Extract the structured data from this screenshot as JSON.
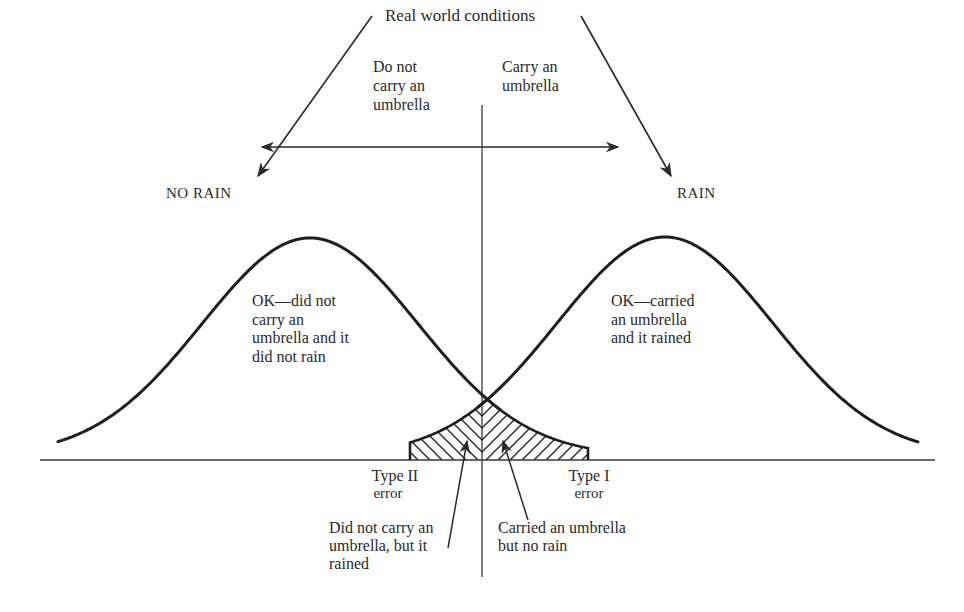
{
  "title": "Real world conditions",
  "decisions": {
    "left": "Do not\ncarry an\numbrella",
    "right": "Carry an\numbrella"
  },
  "states": {
    "left": "NO RAIN",
    "right": "RAIN"
  },
  "regions": {
    "left_ok": "OK—did not\ncarry an\numbrella and it\ndid not rain",
    "right_ok": "OK—carried\nan umbrella\nand it rained"
  },
  "errors": {
    "type2": {
      "title": "Type II",
      "sub": "error",
      "description": "Did not carry an\numbrella, but it\nrained"
    },
    "type1": {
      "title": "Type I",
      "sub": "error",
      "description": "Carried an umbrella\nbut no rain"
    }
  },
  "colors": {
    "ink": "#2a2a2a",
    "background": "#ffffff"
  },
  "geometry": {
    "baseline_y": 460,
    "baseline_x": [
      40,
      935
    ],
    "criterion_x": 482,
    "criterion_y": [
      105,
      577
    ],
    "left_curve": {
      "mean_x": 310,
      "peak_y": 238,
      "sigma": 108,
      "x_range": [
        58,
        500
      ]
    },
    "right_curve": {
      "mean_x": 665,
      "peak_y": 237,
      "sigma": 108,
      "x_range": [
        478,
        918
      ]
    },
    "hatch_x": [
      410,
      588
    ]
  }
}
